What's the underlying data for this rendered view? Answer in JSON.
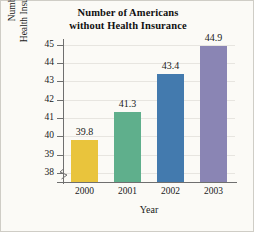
{
  "chart_data": {
    "type": "bar",
    "title": "Number of Americans without Health Insurance",
    "title_lines": [
      "Number of Americans",
      "without Health Insurance"
    ],
    "categories": [
      "2000",
      "2001",
      "2002",
      "2003"
    ],
    "values": [
      39.8,
      41.3,
      43.4,
      44.9
    ],
    "value_labels": [
      "39.8",
      "41.3",
      "43.4",
      "44.9"
    ],
    "series": [
      {
        "name": "Number without Health Insurance (millions)",
        "values": [
          39.8,
          41.3,
          43.4,
          44.9
        ]
      }
    ],
    "xlabel": "Year",
    "ylabel": "Number without Health Insurance (millions)",
    "ylabel_lines": [
      "Number without",
      "Health Insurance (millions)"
    ],
    "ylim": [
      37.5,
      45.3
    ],
    "ytick_values": [
      38,
      39,
      40,
      41,
      42,
      43,
      44,
      45
    ],
    "ytick_labels": [
      "38",
      "39",
      "40",
      "41",
      "42",
      "43",
      "44",
      "45"
    ],
    "grid": true,
    "legend": false,
    "axis_break": true,
    "bar_colors": [
      "#e9c43c",
      "#5faf8c",
      "#437aae",
      "#8a85b4"
    ],
    "colors": {
      "axis": "#6f6f6f",
      "gridline": "#e7e5e0",
      "text": "#1a1a1a",
      "background": "#fbfaf6",
      "border": "#cfcdc6"
    }
  }
}
